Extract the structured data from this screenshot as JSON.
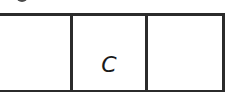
{
  "diagram": {
    "type": "row-of-cells",
    "cells": [
      {
        "label": ""
      },
      {
        "label": "C"
      },
      {
        "label": ""
      }
    ],
    "border_color": "#2b2b2b",
    "background_color": "#ffffff"
  }
}
